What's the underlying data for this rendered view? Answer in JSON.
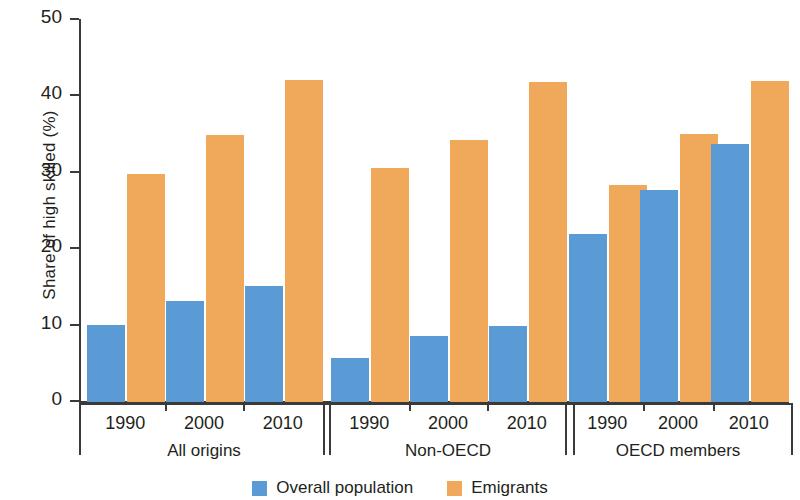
{
  "chart_data": {
    "type": "bar",
    "title": "",
    "xlabel": "",
    "ylabel": "Share of high skilled (%)",
    "ylim": [
      0,
      50
    ],
    "yticks": [
      0,
      10,
      20,
      30,
      40,
      50
    ],
    "grid": false,
    "legend_position": "bottom",
    "categories": [
      "1990",
      "2000",
      "2010"
    ],
    "groups": [
      {
        "name": "All origins",
        "categories": [
          "1990",
          "2000",
          "2010"
        ],
        "series": [
          {
            "name": "Overall population",
            "color": "#5b9bd5",
            "values": [
              10.1,
              13.2,
              15.2
            ]
          },
          {
            "name": "Emigrants",
            "color": "#f0a85a",
            "values": [
              29.8,
              34.9,
              42.1
            ]
          }
        ]
      },
      {
        "name": "Non-OECD",
        "categories": [
          "1990",
          "2000",
          "2010"
        ],
        "series": [
          {
            "name": "Overall population",
            "color": "#5b9bd5",
            "values": [
              5.8,
              8.6,
              10.0
            ]
          },
          {
            "name": "Emigrants",
            "color": "#f0a85a",
            "values": [
              30.6,
              34.3,
              41.9
            ]
          }
        ]
      },
      {
        "name": "OECD members",
        "categories": [
          "1990",
          "2000",
          "2010"
        ],
        "series": [
          {
            "name": "Overall population",
            "color": "#5b9bd5",
            "values": [
              22.0,
              27.8,
              33.8
            ]
          },
          {
            "name": "Emigrants",
            "color": "#f0a85a",
            "values": [
              28.4,
              35.1,
              42.0
            ]
          }
        ]
      }
    ],
    "series_names": [
      "Overall population",
      "Emigrants"
    ]
  },
  "axis": {
    "y_title": "Share of high skilled (%)",
    "y_tick_labels": [
      "0",
      "10",
      "20",
      "30",
      "40",
      "50"
    ]
  },
  "legend": {
    "items": [
      {
        "label": "Overall population",
        "color": "#5b9bd5"
      },
      {
        "label": "Emigrants",
        "color": "#f0a85a"
      }
    ]
  },
  "colors": {
    "overall_population": "#5b9bd5",
    "emigrants": "#f0a85a",
    "axis": "#3a3a3a",
    "text": "#231f20",
    "background": "#ffffff"
  }
}
